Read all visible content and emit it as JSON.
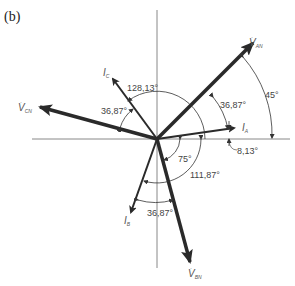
{
  "figure": {
    "panel_label": "(b)",
    "type": "phasor_diagram",
    "origin": [
      157,
      139
    ],
    "colors": {
      "axis": "#888888",
      "vector": "#2a2a2a",
      "arc": "#333333",
      "text": "#444444"
    },
    "vectors": [
      {
        "name": "V_AN",
        "label": "V",
        "sub": "AN",
        "angle_deg": 45,
        "kind": "voltage"
      },
      {
        "name": "V_BN",
        "label": "V",
        "sub": "BN",
        "angle_deg": -75,
        "kind": "voltage"
      },
      {
        "name": "V_CN",
        "label": "V",
        "sub": "CN",
        "angle_deg": 165,
        "kind": "voltage"
      },
      {
        "name": "I_A",
        "label": "I",
        "sub": "A",
        "angle_deg": 8.13,
        "kind": "current"
      },
      {
        "name": "I_B",
        "label": "I",
        "sub": "B",
        "angle_deg": -111.87,
        "kind": "current"
      },
      {
        "name": "I_C",
        "label": "I",
        "sub": "C",
        "angle_deg": 128.13,
        "kind": "current"
      }
    ],
    "angle_labels": {
      "a45": "45°",
      "a3687_top": "36,87°",
      "a813": "8,13°",
      "a12813": "128,13°",
      "a3687_left": "36,87°",
      "a75": "75°",
      "a11187": "111,87°",
      "a3687_bottom": "36,87°"
    },
    "vector_labels": {
      "van": {
        "main": "V",
        "sub": "AN"
      },
      "vbn": {
        "main": "V",
        "sub": "BN"
      },
      "vcn": {
        "main": "V",
        "sub": "CN"
      },
      "ia": {
        "main": "I",
        "sub": "A"
      },
      "ib": {
        "main": "I",
        "sub": "B"
      },
      "ic": {
        "main": "I",
        "sub": "C"
      }
    }
  }
}
